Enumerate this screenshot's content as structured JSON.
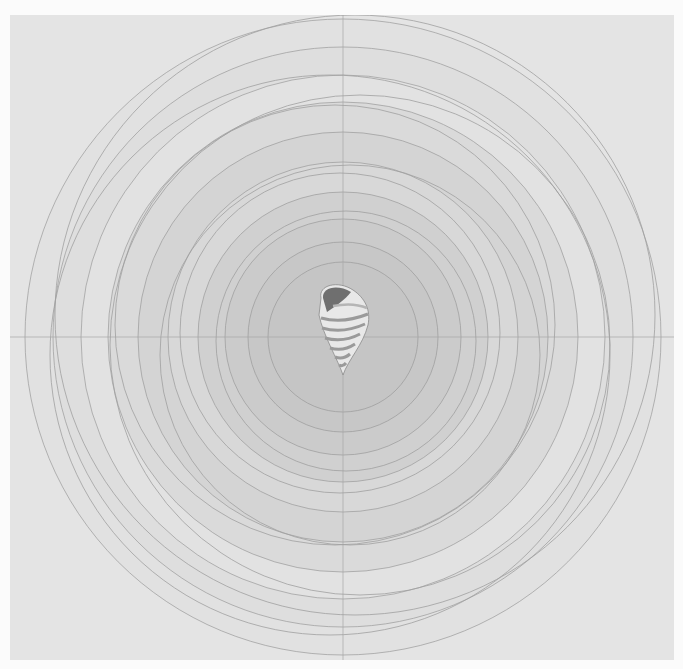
{
  "artwork": {
    "subject": "concentric circles with striped seashell at center",
    "colors": {
      "paper": "#fbfbfb",
      "canvas": "#e4e4e4",
      "ring_light": "#e0e0e0",
      "ring_mid": "#d6d6d6",
      "ring_dark": "#cbcbcb",
      "center": "#c4c4c4",
      "line": "#9a9a9a",
      "shell_dark": "#6f6f6f",
      "shell_light": "#f2f2f2"
    },
    "center": {
      "x": 333,
      "y": 322
    },
    "rings": [
      {
        "r": 318,
        "fill": "#e1e1e1"
      },
      {
        "r": 290,
        "fill": "#dedede"
      },
      {
        "r": 262,
        "fill": "#e2e2e2"
      },
      {
        "r": 235,
        "fill": "#dadada"
      },
      {
        "r": 205,
        "fill": "#d4d4d4"
      },
      {
        "r": 175,
        "fill": "#d8d8d8"
      },
      {
        "r": 145,
        "fill": "#d0d0d0"
      },
      {
        "r": 118,
        "fill": "#cbcbcb"
      },
      {
        "r": 95,
        "fill": "#c7c7c7"
      },
      {
        "r": 75,
        "fill": "#c5c5c5"
      }
    ]
  }
}
